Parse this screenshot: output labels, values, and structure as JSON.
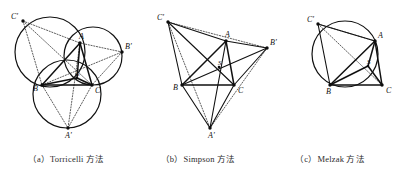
{
  "figure": {
    "kind": "geometry-diagram",
    "panel_count": 3
  },
  "captions": [
    {
      "id": "a",
      "index": "（a）",
      "label": "（a）Torricelli 方法"
    },
    {
      "id": "b",
      "index": "（b）",
      "label": "（b）Simpson 方法"
    },
    {
      "id": "c",
      "index": "（c）",
      "label": "（c）Melzak 方法"
    }
  ],
  "point_labels": {
    "A": "A",
    "B": "B",
    "C": "C",
    "A_prime": "A'",
    "B_prime": "B'",
    "C_prime": "C'",
    "S": "S"
  },
  "panels": {
    "a": {
      "caption": "（a）Torricelli 方法",
      "method": "Torricelli",
      "points": {
        "A": {
          "x": 80,
          "y": 43,
          "label": "A",
          "label_dx": -1,
          "label_dy": -4
        },
        "B": {
          "x": 42,
          "y": 85,
          "label": "B",
          "label_dx": -9,
          "label_dy": 6
        },
        "C": {
          "x": 92,
          "y": 85,
          "label": "C",
          "label_dx": 3,
          "label_dy": 8
        },
        "Ap": {
          "x": 68,
          "y": 128,
          "label": "A'",
          "label_dx": -3,
          "label_dy": 10
        },
        "Bp": {
          "x": 122,
          "y": 52,
          "label": "B'",
          "label_dx": 3,
          "label_dy": -3
        },
        "Cp": {
          "x": 23,
          "y": 21,
          "label": "C'",
          "label_dx": -12,
          "label_dy": -2
        },
        "S": {
          "x": 77,
          "y": 78,
          "label": "S",
          "label_dx": -1,
          "label_dy": -2
        }
      },
      "circles": [
        {
          "name": "circumcircle-ABC'",
          "cx": 50,
          "cy": 52,
          "r": 35
        },
        {
          "name": "circumcircle-ACB'",
          "cx": 93,
          "cy": 56,
          "r": 29
        },
        {
          "name": "circumcircle-BCA'",
          "cx": 67,
          "cy": 94,
          "r": 34
        }
      ],
      "solid_segments": [
        [
          "A",
          "B"
        ],
        [
          "B",
          "C"
        ],
        [
          "C",
          "A"
        ],
        [
          "S",
          "A"
        ],
        [
          "S",
          "B"
        ],
        [
          "S",
          "C"
        ]
      ],
      "dotted_segments": [
        [
          "Cp",
          "A"
        ],
        [
          "Cp",
          "B"
        ],
        [
          "A",
          "Bp"
        ],
        [
          "Bp",
          "C"
        ],
        [
          "B",
          "Ap"
        ],
        [
          "Ap",
          "C"
        ],
        [
          "Cp",
          "C"
        ],
        [
          "A",
          "Ap"
        ],
        [
          "B",
          "Bp"
        ]
      ]
    },
    "b": {
      "caption": "（b）Simpson 方法",
      "method": "Simpson",
      "points": {
        "A": {
          "x": 226,
          "y": 41,
          "label": "A",
          "label_dx": -1,
          "label_dy": -4
        },
        "B": {
          "x": 182,
          "y": 85,
          "label": "B",
          "label_dx": -9,
          "label_dy": 5
        },
        "C": {
          "x": 234,
          "y": 85,
          "label": "C",
          "label_dx": 4,
          "label_dy": 8
        },
        "Ap": {
          "x": 210,
          "y": 128,
          "label": "A'",
          "label_dx": -2,
          "label_dy": 10
        },
        "Bp": {
          "x": 267,
          "y": 48,
          "label": "B'",
          "label_dx": 3,
          "label_dy": -3
        },
        "Cp": {
          "x": 168,
          "y": 22,
          "label": "C'",
          "label_dx": -11,
          "label_dy": -2
        },
        "S": {
          "x": 219,
          "y": 67,
          "label": "S",
          "label_dx": -1,
          "label_dy": -2
        }
      },
      "circles": [],
      "solid_segments": [
        [
          "A",
          "B"
        ],
        [
          "B",
          "C"
        ],
        [
          "C",
          "A"
        ],
        [
          "Cp",
          "A"
        ],
        [
          "Cp",
          "B"
        ],
        [
          "A",
          "Bp"
        ],
        [
          "Bp",
          "C"
        ],
        [
          "B",
          "Ap"
        ],
        [
          "Ap",
          "C"
        ],
        [
          "Cp",
          "C"
        ],
        [
          "B",
          "Bp"
        ],
        [
          "A",
          "Ap"
        ]
      ],
      "dotted_segments": [
        [
          "Cp",
          "Bp"
        ],
        [
          "Cp",
          "Ap"
        ],
        [
          "Bp",
          "Ap"
        ]
      ]
    },
    "c": {
      "caption": "（c）Melzak 方法",
      "method": "Melzak",
      "points": {
        "A": {
          "x": 375,
          "y": 41,
          "label": "A",
          "label_dx": 3,
          "label_dy": -3
        },
        "B": {
          "x": 330,
          "y": 85,
          "label": "B",
          "label_dx": -4,
          "label_dy": 9
        },
        "C": {
          "x": 382,
          "y": 85,
          "label": "C",
          "label_dx": 4,
          "label_dy": 8
        },
        "Cp": {
          "x": 318,
          "y": 24,
          "label": "C'",
          "label_dx": -11,
          "label_dy": -2
        },
        "S": {
          "x": 368,
          "y": 66,
          "label": "S",
          "label_dx": -1,
          "label_dy": -2
        }
      },
      "circles": [
        {
          "name": "circumcircle-ABC'",
          "cx": 345,
          "cy": 54,
          "r": 33
        }
      ],
      "solid_segments": [
        [
          "A",
          "B"
        ],
        [
          "B",
          "C"
        ],
        [
          "C",
          "A"
        ],
        [
          "Cp",
          "A"
        ],
        [
          "Cp",
          "B"
        ],
        [
          "S",
          "A"
        ],
        [
          "S",
          "B"
        ],
        [
          "S",
          "C"
        ]
      ],
      "dotted_segments": [
        [
          "Cp",
          "A"
        ],
        [
          "Cp",
          "C"
        ]
      ]
    }
  },
  "colors": {
    "ink": "#111111",
    "dotted": "#333333",
    "caption": "#2b2b2b",
    "background": "#ffffff"
  }
}
